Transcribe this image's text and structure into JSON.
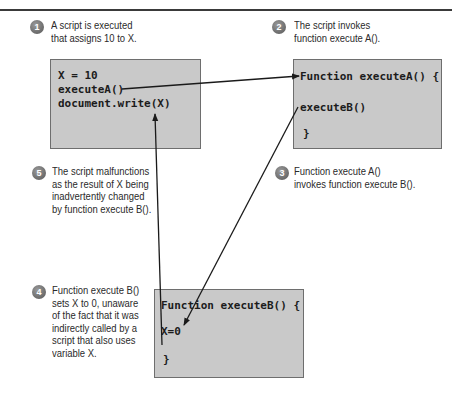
{
  "steps": [
    {
      "number": "1",
      "text": "A script is executed\nthat assigns 10 to X."
    },
    {
      "number": "2",
      "text": "The script invokes\nfunction execute A()."
    },
    {
      "number": "3",
      "text": "Function execute A()\ninvokes function execute B()."
    },
    {
      "number": "4",
      "text": "Function execute B()\nsets X to 0, unaware\nof the fact that it was\nindirectly called by a\nscript that also uses\nvariable X."
    },
    {
      "number": "5",
      "text": "The script malfunctions\nas the result of X being\ninadvertently changed\nby function execute B()."
    }
  ],
  "boxes": {
    "script": {
      "lines": [
        "X = 10",
        "executeA()",
        "document.write(X)"
      ]
    },
    "functionA": {
      "lines": [
        "Function executeA() {",
        "executeB()",
        "}"
      ]
    },
    "functionB": {
      "lines": [
        "Function executeB() {",
        "X=0",
        "}"
      ]
    }
  },
  "colors": {
    "box_fill": "#c9c9c9",
    "box_border": "#6e6e6e",
    "badge": "#7a7a7a",
    "arrow": "#1a1a1a"
  }
}
